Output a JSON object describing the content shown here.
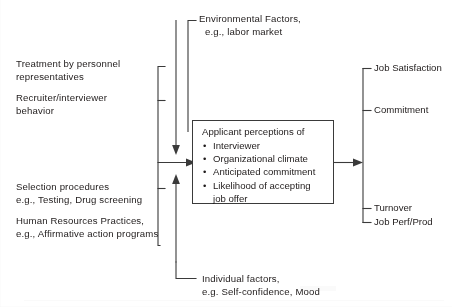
{
  "diagram": {
    "title_implied": "Model of applicant perceptions in recruitment and selection",
    "type": "flowchart",
    "top_context": {
      "line1": "Environmental Factors,",
      "line2": "e.g., labor market"
    },
    "bottom_context": {
      "line1": "Individual factors,",
      "line2": "e.g. Self-confidence, Mood"
    },
    "left_inputs": [
      {
        "line1": "Treatment by personnel",
        "line2": "representatives"
      },
      {
        "line1": "Recruiter/interviewer",
        "line2": "behavior"
      },
      {
        "line1": "Selection procedures",
        "line2": "e.g., Testing, Drug screening"
      },
      {
        "line1": "Human Resources Practices,",
        "line2": "e.g., Affirmative action programs"
      }
    ],
    "center_box": {
      "heading": "Applicant perceptions of",
      "items": [
        "Interviewer",
        "Organizational climate",
        "Anticipated commitment",
        "Likelihood of accepting"
      ],
      "item_last_wrap": "job offer",
      "bullet_glyph": "•"
    },
    "outcomes": [
      "Job Satisfaction",
      "Commitment",
      "Turnover",
      "Job Perf/Prod"
    ],
    "colors": {
      "ink": "#201c1c",
      "line": "#3a3a3a",
      "background": "#ffffff"
    }
  }
}
